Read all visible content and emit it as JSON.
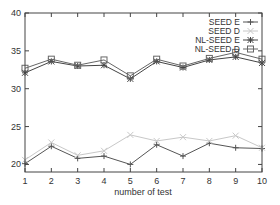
{
  "chart_data": {
    "type": "line",
    "title": "",
    "xlabel": "number of test",
    "ylabel": "",
    "x": [
      1,
      2,
      3,
      4,
      5,
      6,
      7,
      8,
      9,
      10
    ],
    "xlim": [
      1,
      10
    ],
    "ylim": [
      19,
      40
    ],
    "yticks": [
      20,
      25,
      30,
      35,
      40
    ],
    "xticks": [
      1,
      2,
      3,
      4,
      5,
      6,
      7,
      8,
      9,
      10
    ],
    "grid": false,
    "legend_position": "upper right",
    "series": [
      {
        "name": "SEED E",
        "marker": "plus",
        "color": "#555555",
        "values": [
          20.1,
          22.4,
          20.8,
          21.1,
          20.0,
          22.6,
          21.1,
          22.8,
          22.2,
          22.1
        ]
      },
      {
        "name": "SEED D",
        "marker": "cross",
        "color": "#c8c8c8",
        "values": [
          20.6,
          22.9,
          21.2,
          21.8,
          23.9,
          23.1,
          23.6,
          23.1,
          23.8,
          22.2
        ]
      },
      {
        "name": "NL-SEED E",
        "marker": "star",
        "color": "#444444",
        "values": [
          32.1,
          33.6,
          33.0,
          33.1,
          31.3,
          33.6,
          32.8,
          33.8,
          34.2,
          33.4
        ]
      },
      {
        "name": "NL-SEED D",
        "marker": "square",
        "color": "#666666",
        "values": [
          32.7,
          33.9,
          33.1,
          33.8,
          31.7,
          33.9,
          33.0,
          34.0,
          34.8,
          33.9
        ]
      }
    ]
  }
}
